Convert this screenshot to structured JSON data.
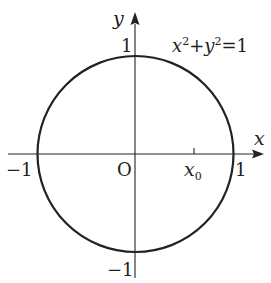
{
  "diagram": {
    "type": "unit-circle",
    "equation": {
      "x_term": "x",
      "x_exp": "2",
      "plus": "+",
      "y_term": "y",
      "y_exp": "2",
      "equals": "=1"
    },
    "axes": {
      "x_label": "x",
      "y_label": "y",
      "origin_label": "O"
    },
    "ticks": {
      "x_neg": "−1",
      "x_pos": "1",
      "y_pos": "1",
      "y_neg": "−1",
      "x0_base": "x",
      "x0_sub": "0"
    },
    "colors": {
      "stroke": "#222222",
      "background": "#ffffff"
    }
  }
}
